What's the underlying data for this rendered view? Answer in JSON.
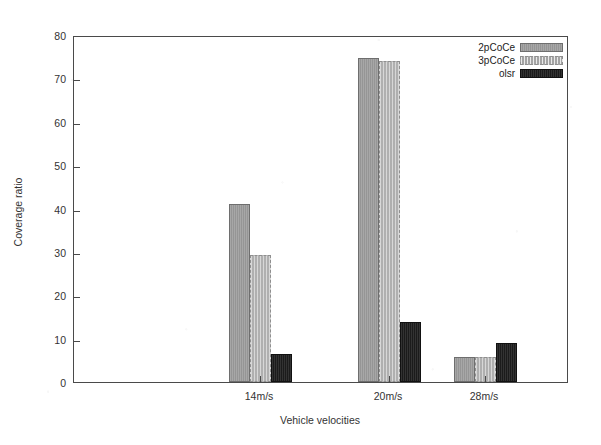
{
  "chart_data": {
    "type": "bar",
    "title": "",
    "xlabel": "Vehicle velocities",
    "ylabel": "Coverage ratio",
    "categories": [
      "14m/s",
      "20m/s",
      "28m/s"
    ],
    "series": [
      {
        "name": "2pCoCe",
        "values": [
          41.0,
          74.8,
          5.7
        ],
        "color": "#9d9d9d"
      },
      {
        "name": "3pCoCe",
        "values": [
          29.2,
          74.0,
          5.8
        ],
        "color": "#c2c2c2"
      },
      {
        "name": "olsr",
        "values": [
          6.5,
          13.8,
          9.0
        ],
        "color": "#262626"
      }
    ],
    "ylim": [
      0,
      80
    ],
    "yticks": [
      0,
      10,
      20,
      30,
      40,
      50,
      60,
      70,
      80
    ],
    "ytick_labels": [
      "0",
      "10",
      "20",
      "30",
      "40",
      "50",
      "60",
      "70",
      "80"
    ],
    "grid": false,
    "legend_position": "top-right",
    "legend_entries": [
      "2pCoCe",
      "3pCoCe",
      "olsr"
    ]
  },
  "figure": {
    "background": "#ffffff",
    "frame_color": "#4a4a4a"
  }
}
